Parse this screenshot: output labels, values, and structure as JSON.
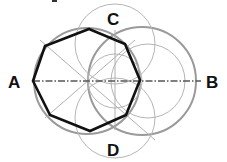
{
  "diagram": {
    "labels": {
      "A": "A",
      "B": "B",
      "C": "C",
      "D": "D"
    },
    "colors": {
      "polygon": "#111111",
      "construction": "#a8a8a8",
      "construction_thick": "#9a9a9a",
      "axis": "#555555"
    }
  }
}
